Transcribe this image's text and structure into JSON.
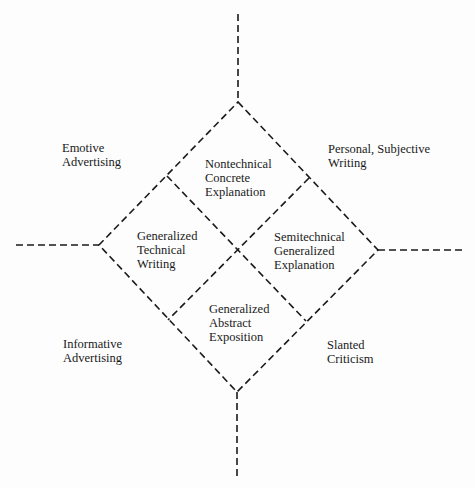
{
  "diagram": {
    "stroke_color": "#1a1a1a",
    "background": "#fdfdfd",
    "inner_regions": [
      {
        "id": "top",
        "lines": [
          "Nontechnical",
          "Concrete",
          "Explanation"
        ]
      },
      {
        "id": "left",
        "lines": [
          "Generalized",
          "Technical",
          "Writing"
        ]
      },
      {
        "id": "right",
        "lines": [
          "Semitechnical",
          "Generalized",
          "Explanation"
        ]
      },
      {
        "id": "bottom",
        "lines": [
          "Generalized",
          "Abstract",
          "Exposition"
        ]
      }
    ],
    "outer_regions": [
      {
        "id": "upper-left",
        "lines": [
          "Emotive",
          "Advertising"
        ]
      },
      {
        "id": "upper-right",
        "lines": [
          "Personal, Subjective",
          "Writing"
        ]
      },
      {
        "id": "lower-left",
        "lines": [
          "Informative",
          "Advertising"
        ]
      },
      {
        "id": "lower-right",
        "lines": [
          "Slanted",
          "Criticism"
        ]
      }
    ]
  }
}
